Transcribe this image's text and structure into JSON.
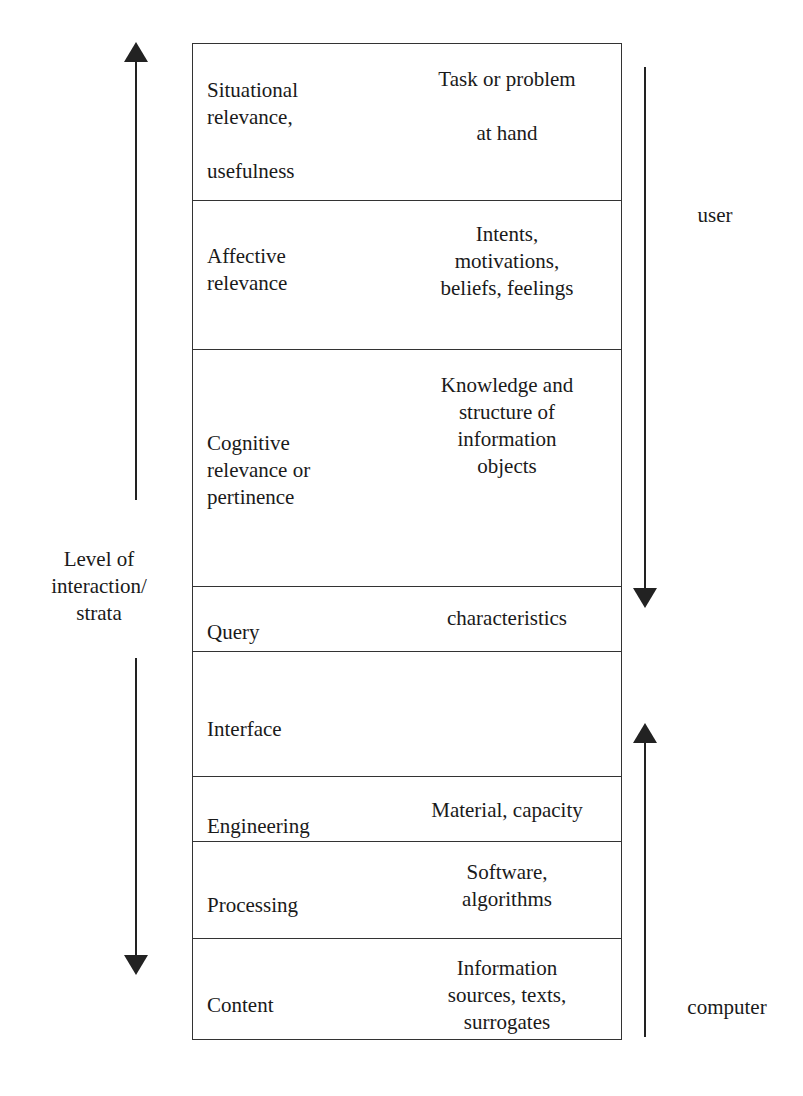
{
  "diagram": {
    "strata": [
      {
        "label": "Situational\nrelevance,\n\nusefulness",
        "description": "Task or problem\n\nat hand"
      },
      {
        "label": "Affective\nrelevance",
        "description": "Intents,\nmotivations,\nbeliefs, feelings"
      },
      {
        "label": "Cognitive\nrelevance or\npertinence",
        "description": "Knowledge and\nstructure of\ninformation\nobjects"
      },
      {
        "label": "Query",
        "description": "characteristics"
      },
      {
        "label": "Interface",
        "description": ""
      },
      {
        "label": "Engineering",
        "description": "Material, capacity"
      },
      {
        "label": "Processing",
        "description": "Software,\nalgorithms"
      },
      {
        "label": "Content",
        "description": "Information\nsources, texts,\nsurrogates"
      }
    ],
    "left_label": "Level of\ninteraction/\nstrata",
    "user_label": "user",
    "computer_label": "computer",
    "line_color": "#333333"
  }
}
